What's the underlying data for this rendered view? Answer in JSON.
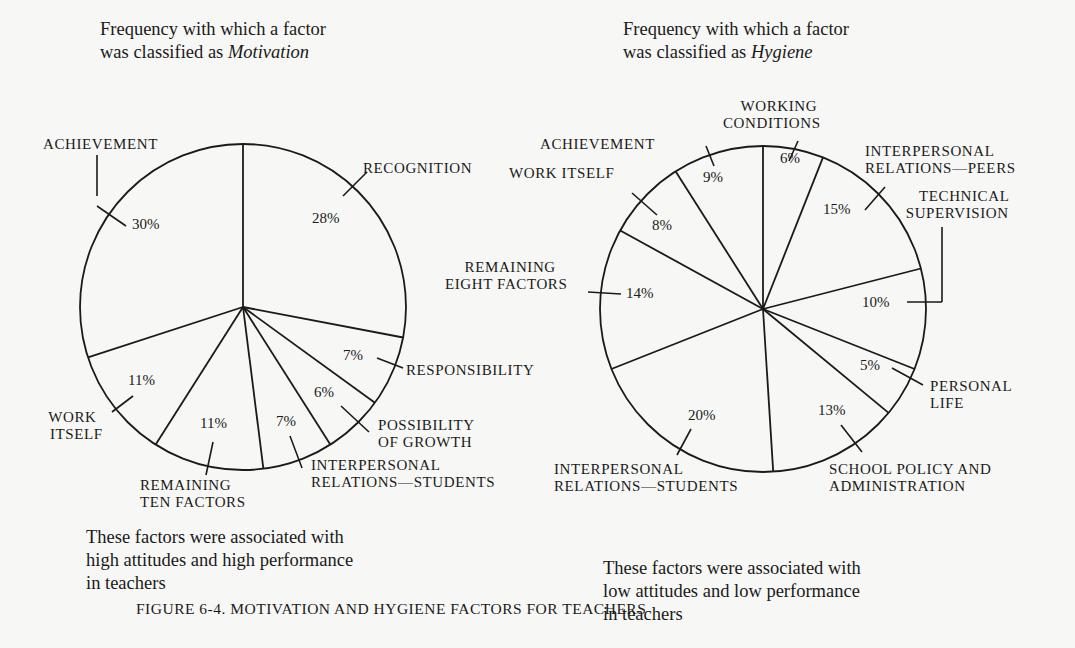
{
  "figure_caption": "FIGURE 6-4. MOTIVATION AND HYGIENE FACTORS FOR TEACHERS",
  "left": {
    "heading_line1": "Frequency with which a factor",
    "heading_line2_prefix": "was classified as ",
    "heading_line2_em": "Motivation",
    "footer_line1": "These factors were associated with",
    "footer_line2": "high attitudes and high performance",
    "footer_line3": "in teachers",
    "labels": {
      "recognition": "RECOGNITION",
      "responsibility": "RESPONSIBILITY",
      "growth_1": "POSSIBILITY",
      "growth_2": "OF GROWTH",
      "irs_1": "INTERPERSONAL",
      "irs_2": "RELATIONS—STUDENTS",
      "remaining_1": "REMAINING",
      "remaining_2": "TEN FACTORS",
      "work_1": "WORK",
      "work_2": "ITSELF",
      "achievement": "ACHIEVEMENT"
    },
    "pcts": {
      "recognition": "28%",
      "responsibility": "7%",
      "growth": "6%",
      "irs": "7%",
      "remaining": "11%",
      "work": "11%",
      "achievement": "30%"
    }
  },
  "right": {
    "heading_line1": "Frequency with which a factor",
    "heading_line2_prefix": "was classified as ",
    "heading_line2_em": "Hygiene",
    "footer_line1": "These factors were associated with",
    "footer_line2": "low attitudes and low performance",
    "footer_line3": "in teachers",
    "labels": {
      "working_1": "WORKING",
      "working_2": "CONDITIONS",
      "peers_1": "INTERPERSONAL",
      "peers_2": "RELATIONS—PEERS",
      "tech_1": "TECHNICAL",
      "tech_2": "SUPERVISION",
      "personal_1": "PERSONAL",
      "personal_2": "LIFE",
      "school_1": "SCHOOL POLICY AND",
      "school_2": "ADMINISTRATION",
      "irs_1": "INTERPERSONAL",
      "irs_2": "RELATIONS—STUDENTS",
      "remaining_1": "REMAINING",
      "remaining_2": "EIGHT FACTORS",
      "work": "WORK ITSELF",
      "achievement": "ACHIEVEMENT"
    },
    "pcts": {
      "working": "6%",
      "peers": "15%",
      "tech": "10%",
      "personal": "5%",
      "school": "13%",
      "irs": "20%",
      "remaining": "14%",
      "work": "8%",
      "achievement": "9%"
    }
  },
  "chart_data": [
    {
      "type": "pie",
      "title": "Frequency with which a factor was classified as Motivation",
      "subtitle": "These factors were associated with high attitudes and high performance in teachers",
      "categories": [
        "Recognition",
        "Responsibility",
        "Possibility of Growth",
        "Interpersonal Relations—Students",
        "Remaining Ten Factors",
        "Work Itself",
        "Achievement"
      ],
      "values": [
        28,
        7,
        6,
        7,
        11,
        11,
        30
      ],
      "start_angle_deg": 0,
      "direction": "clockwise",
      "legend": "none (direct labels)"
    },
    {
      "type": "pie",
      "title": "Frequency with which a factor was classified as Hygiene",
      "subtitle": "These factors were associated with low attitudes and low performance in teachers",
      "categories": [
        "Working Conditions",
        "Interpersonal Relations—Peers",
        "Technical Supervision",
        "Personal Life",
        "School Policy and Administration",
        "Interpersonal Relations—Students",
        "Remaining Eight Factors",
        "Work Itself",
        "Achievement"
      ],
      "values": [
        6,
        15,
        10,
        5,
        13,
        20,
        14,
        8,
        9
      ],
      "start_angle_deg": 0,
      "direction": "clockwise",
      "legend": "none (direct labels)"
    }
  ]
}
